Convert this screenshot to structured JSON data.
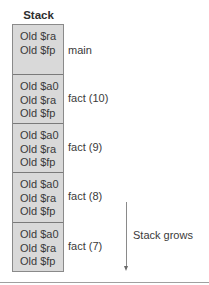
{
  "title": "Stack",
  "frames": [
    {
      "lines": [
        "Old $ra",
        "Old $fp"
      ],
      "label": "main"
    },
    {
      "lines": [
        "Old $a0",
        "Old $ra",
        "Old $fp"
      ],
      "label": "fact (10)"
    },
    {
      "lines": [
        "Old $a0",
        "Old $ra",
        "Old $fp"
      ],
      "label": "fact (9)"
    },
    {
      "lines": [
        "Old $a0",
        "Old $ra",
        "Old $fp"
      ],
      "label": "fact (8)"
    },
    {
      "lines": [
        "Old $a0",
        "Old $ra",
        "Old $fp"
      ],
      "label": "fact (7)"
    }
  ],
  "arrow_label": "Stack grows",
  "colors": {
    "frame_fill": "#d9d9d9",
    "border": "#8a8a8a",
    "text": "#3a3a3a"
  }
}
